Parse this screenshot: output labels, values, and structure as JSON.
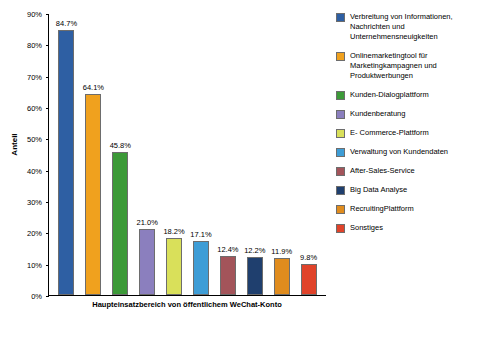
{
  "chart_data": {
    "type": "bar",
    "title": "",
    "xlabel": "Haupteinsatzbereich von öffentlichem WeChat-Konto",
    "ylabel": "Anteil",
    "ylim": [
      0,
      90
    ],
    "ytick_labels": [
      "0%",
      "10%",
      "20%",
      "30%",
      "40%",
      "50%",
      "60%",
      "70%",
      "80%",
      "90%"
    ],
    "ytick_values": [
      0,
      10,
      20,
      30,
      40,
      50,
      60,
      70,
      80,
      90
    ],
    "grid": false,
    "legend_position": "right",
    "categories": [
      "Verbreitung von Informationen, Nachrichten und Unternehmensneuigkeiten",
      "Onlinemarketingtool für Marketingkampagnen und Produktwerbungen",
      "Kunden-Dialogplattform",
      "Kundenberatung",
      "E-Commerce-Plattform",
      "Verwaltung von Kundendaten",
      "After-Sales-Service",
      "Big Data Analyse",
      "RecruitingPlattform",
      "Sonstiges"
    ],
    "values": [
      84.7,
      64.1,
      45.8,
      21.0,
      18.2,
      17.1,
      12.4,
      12.2,
      11.9,
      9.8
    ],
    "value_labels": [
      "84.7%",
      "64.1%",
      "45.8%",
      "21.0%",
      "18.2%",
      "17.1%",
      "12.4%",
      "12.2%",
      "11.9%",
      "9.8%"
    ],
    "colors": [
      "#2e5fa3",
      "#f0a11e",
      "#3c9a38",
      "#8b7fbe",
      "#d9e05a",
      "#3e9dd6",
      "#a3545a",
      "#1f3f6e",
      "#e08c1e",
      "#e0432a"
    ]
  },
  "legend": {
    "items": [
      {
        "label": "Verbreitung von Informationen, Nachrichten und Unternehmensneuigkeiten",
        "color": "#2e5fa3"
      },
      {
        "label": "Onlinemarketingtool für Marketingkampagnen und Produktwerbungen",
        "color": "#f0a11e"
      },
      {
        "label": "Kunden-Dialogplattform",
        "color": "#3c9a38"
      },
      {
        "label": "Kundenberatung",
        "color": "#8b7fbe"
      },
      {
        "label": "E- Commerce-Plattform",
        "color": "#d9e05a"
      },
      {
        "label": "Verwaltung von Kundendaten",
        "color": "#3e9dd6"
      },
      {
        "label": "After-Sales-Service",
        "color": "#a3545a"
      },
      {
        "label": "Big Data Analyse",
        "color": "#1f3f6e"
      },
      {
        "label": "RecruitingPlattform",
        "color": "#e08c1e"
      },
      {
        "label": "Sonstiges",
        "color": "#e0432a"
      }
    ]
  }
}
